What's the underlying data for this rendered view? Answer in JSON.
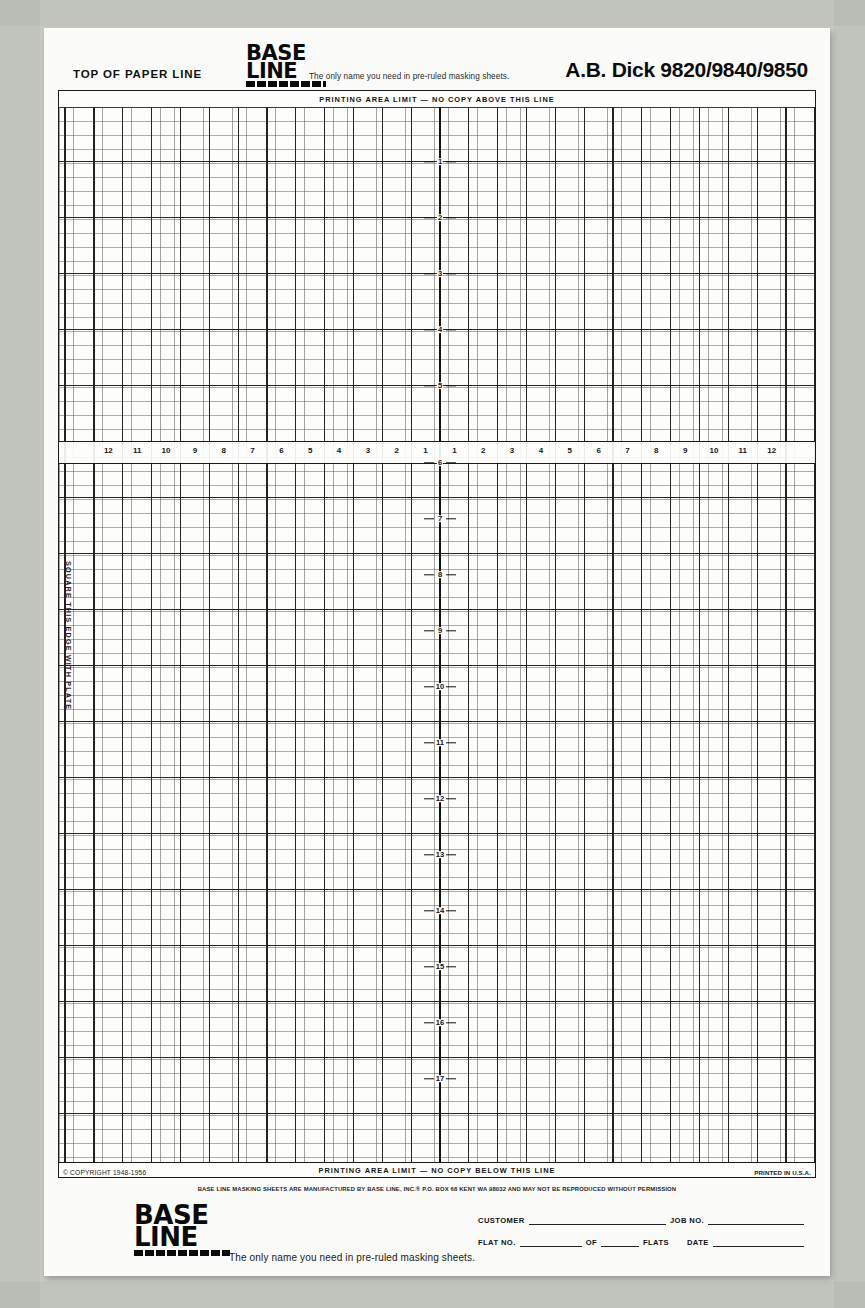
{
  "document": {
    "machine_title": "A.B. Dick 9820/9840/9850",
    "top_of_paper_label": "TOP OF PAPER LINE",
    "brand_line1": "BASE",
    "brand_line2": "LINE",
    "brand_registered": "®",
    "brand_tagline_header": "The only name you need in pre-ruled masking sheets.",
    "brand_tagline_footer": "The only name you need in pre-ruled masking sheets.",
    "limit_top": "PRINTING AREA LIMIT — NO COPY ABOVE THIS LINE",
    "limit_bottom": "PRINTING AREA LIMIT — NO COPY BELOW THIS LINE",
    "square_edge_caption": "SQUARE THIS EDGE WITH PLATE",
    "copyright": "© COPYRIGHT 1948-1956",
    "printed_in": "PRINTED IN U.S.A.",
    "manufacturer_notice": "BASE LINE MASKING SHEETS ARE MANUFACTURED BY BASE LINE, INC.® P.O. BOX 68  KENT  WA 98032 AND MAY NOT BE REPRODUCED WITHOUT PERMISSION"
  },
  "rulers": {
    "horizontal_left": [
      "12",
      "11",
      "10",
      "9",
      "8",
      "7",
      "6",
      "5",
      "4",
      "3",
      "2",
      "1"
    ],
    "horizontal_right": [
      "1",
      "2",
      "3",
      "4",
      "5",
      "6",
      "7",
      "8",
      "9",
      "10",
      "11",
      "12"
    ],
    "vertical_above": [
      "1",
      "2",
      "3",
      "4",
      "5"
    ],
    "vertical_below": [
      "6",
      "7",
      "8",
      "9",
      "10",
      "11",
      "12",
      "13",
      "14",
      "15",
      "16",
      "17"
    ]
  },
  "form": {
    "customer_label": "CUSTOMER",
    "job_no_label": "JOB NO.",
    "flat_no_label": "FLAT NO.",
    "of_label": "OF",
    "flats_label": "FLATS",
    "date_label": "DATE",
    "customer_value": "",
    "job_no_value": "",
    "flat_no_value": "",
    "of_value": "",
    "date_value": ""
  },
  "colors": {
    "paper": "#fbfbf9",
    "backdrop": "#c9cbc4",
    "ink": "#111111",
    "grid_minor": "#5a5a5a",
    "grid_major": "#232323"
  }
}
